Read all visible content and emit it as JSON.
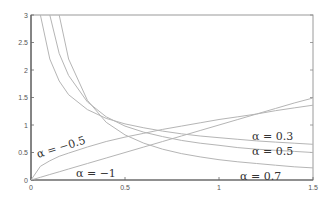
{
  "chart_data": {
    "type": "line",
    "title": "",
    "xlabel": "",
    "ylabel": "",
    "xlim": [
      0,
      1.5
    ],
    "ylim": [
      0,
      3
    ],
    "grid": false,
    "x_ticks": [
      "0",
      "0.5",
      "1",
      "1.5"
    ],
    "y_ticks": [
      "0",
      "0.5",
      "1",
      "1.5",
      "2",
      "2.5",
      "3"
    ],
    "x": [
      0.0,
      0.05,
      0.1,
      0.15,
      0.2,
      0.3,
      0.4,
      0.5,
      0.6,
      0.7,
      0.8,
      0.9,
      1.0,
      1.1,
      1.2,
      1.3,
      1.4,
      1.5
    ],
    "series": [
      {
        "name": "α = −1",
        "label": "α = −1",
        "values": [
          0.0,
          0.05,
          0.1,
          0.15,
          0.2,
          0.3,
          0.4,
          0.5,
          0.6,
          0.7,
          0.8,
          0.9,
          1.0,
          1.1,
          1.2,
          1.3,
          1.4,
          1.49
        ]
      },
      {
        "name": "α = −0.5",
        "label": "α = −0.5",
        "values": [
          0.0,
          0.25,
          0.35,
          0.43,
          0.49,
          0.6,
          0.7,
          0.78,
          0.85,
          0.92,
          0.98,
          1.04,
          1.1,
          1.15,
          1.2,
          1.26,
          1.31,
          1.36
        ]
      },
      {
        "name": "α = 0.3",
        "label": "α = 0.3",
        "values": [
          null,
          3.0,
          2.2,
          1.8,
          1.55,
          1.28,
          1.12,
          1.02,
          0.95,
          0.89,
          0.84,
          0.8,
          0.77,
          0.74,
          0.71,
          0.69,
          0.67,
          0.65
        ]
      },
      {
        "name": "α = 0.5",
        "label": "α = 0.5",
        "values": [
          null,
          null,
          3.0,
          2.3,
          1.9,
          1.42,
          1.15,
          0.98,
          0.87,
          0.79,
          0.72,
          0.67,
          0.63,
          0.59,
          0.56,
          0.54,
          0.52,
          0.5
        ]
      },
      {
        "name": "α = 0.7",
        "label": "α = 0.7",
        "values": [
          null,
          null,
          null,
          3.0,
          2.2,
          1.45,
          1.05,
          0.82,
          0.67,
          0.56,
          0.48,
          0.42,
          0.37,
          0.33,
          0.3,
          0.27,
          0.24,
          0.22
        ]
      }
    ],
    "annotations": [
      {
        "text": "α = −0.5",
        "x": 0.02,
        "y": 0.5
      },
      {
        "text": "α = −1",
        "x": 0.2,
        "y": 0.05
      },
      {
        "text": "α = 0.3",
        "x": 1.25,
        "y": 0.75
      },
      {
        "text": "α = 0.5",
        "x": 1.25,
        "y": 0.52
      },
      {
        "text": "α = 0.7",
        "x": 1.1,
        "y": 0.05
      }
    ]
  },
  "labels": {
    "a_m05": "α = −0.5",
    "a_m1": "α = −1",
    "a_03": "α = 0.3",
    "a_05": "α = 0.5",
    "a_07": "α = 0.7"
  },
  "ticks": {
    "x": [
      "0",
      "0.5",
      "1",
      "1.5"
    ],
    "y": [
      "0",
      "0.5",
      "1",
      "1.5",
      "2",
      "2.5",
      "3"
    ]
  }
}
